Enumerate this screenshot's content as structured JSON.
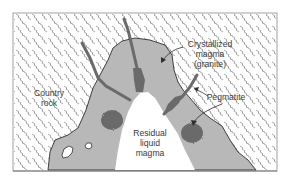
{
  "diagram": {
    "type": "geologic-cross-section",
    "colors": {
      "background": "#ffffff",
      "country_rock_hatch": "#6e6e6e",
      "crystallized_magma": "#b8b8b8",
      "pegmatite": "#6a6a6a",
      "residual_magma": "#ffffff",
      "outline": "#2e2e2e",
      "label_text": "#3a3a3a"
    },
    "labels": {
      "country_rock": [
        "Country",
        "rock"
      ],
      "crystallized_magma": [
        "Crystallized",
        "magma",
        "(granite)"
      ],
      "pegmatite": "Pegmatite",
      "residual_magma": [
        "Residual",
        "liquid",
        "magma"
      ]
    }
  }
}
